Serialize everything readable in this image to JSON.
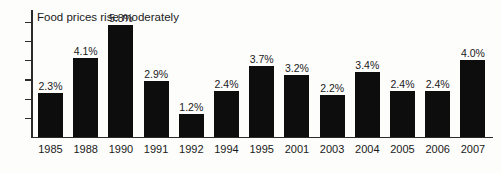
{
  "chart_data": {
    "type": "bar",
    "title": "Food prices rise moderately",
    "xlabel": "",
    "ylabel": "CPI, annual averages",
    "categories": [
      "1985",
      "1988",
      "1990",
      "1991",
      "1992",
      "1994",
      "1995",
      "2001",
      "2003",
      "2004",
      "2005",
      "2006",
      "2007"
    ],
    "values": [
      2.3,
      4.1,
      5.8,
      2.9,
      1.2,
      2.4,
      3.7,
      3.2,
      2.2,
      3.4,
      2.4,
      2.4,
      4.0
    ],
    "value_labels": [
      "2.3%",
      "4.1%",
      "5.8%",
      "2.9%",
      "1.2%",
      "2.4%",
      "3.7%",
      "3.2%",
      "2.2%",
      "3.4%",
      "2.4%",
      "2.4%",
      "4.0%"
    ],
    "ylim": [
      0,
      6.6
    ],
    "y_tick_values": [
      1,
      2,
      3,
      4,
      5,
      6
    ],
    "y_tick_labels_shown": false,
    "grid": false,
    "legend": false,
    "bar_color": "#0d0d0d",
    "axis_color": "#2b2b2b",
    "background_color": "#fdfdfc"
  }
}
